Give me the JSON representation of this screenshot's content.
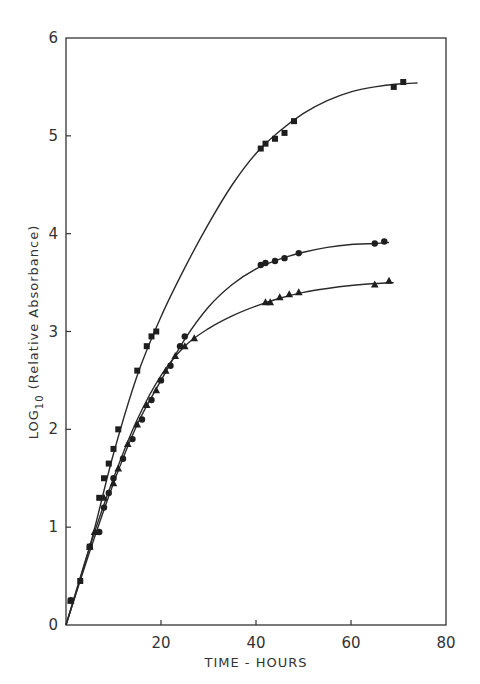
{
  "chart_data": {
    "type": "line",
    "title": "",
    "xlabel": "TIME - HOURS",
    "ylabel": "LOG10 (Relative Absorbance)",
    "ylabel_parts": {
      "main": "LOG",
      "sub": "10",
      "rest": "(Relative Absorbance)"
    },
    "xlim": [
      0,
      80
    ],
    "ylim": [
      0,
      6
    ],
    "x_ticks": [
      20,
      40,
      60,
      80
    ],
    "x_tick_labels": [
      "20",
      "40",
      "60",
      "80"
    ],
    "y_ticks": [
      0,
      1,
      2,
      3,
      4,
      5,
      6
    ],
    "y_tick_labels": [
      "0",
      "1",
      "2",
      "3",
      "4",
      "5",
      "6"
    ],
    "origin_label": "0",
    "grid": false,
    "legend": null,
    "series": [
      {
        "name": "squares",
        "marker": "square",
        "points": [
          [
            1,
            0.25
          ],
          [
            3,
            0.45
          ],
          [
            5,
            0.8
          ],
          [
            7,
            1.3
          ],
          [
            8,
            1.5
          ],
          [
            9,
            1.65
          ],
          [
            10,
            1.8
          ],
          [
            11,
            2.0
          ],
          [
            15,
            2.6
          ],
          [
            17,
            2.85
          ],
          [
            18,
            2.95
          ],
          [
            19,
            3.0
          ],
          [
            41,
            4.87
          ],
          [
            42,
            4.92
          ],
          [
            44,
            4.97
          ],
          [
            46,
            5.03
          ],
          [
            48,
            5.15
          ],
          [
            69,
            5.5
          ],
          [
            71,
            5.55
          ]
        ],
        "curve": [
          [
            0,
            0
          ],
          [
            5,
            0.8
          ],
          [
            10,
            1.75
          ],
          [
            15,
            2.55
          ],
          [
            20,
            3.15
          ],
          [
            25,
            3.65
          ],
          [
            30,
            4.1
          ],
          [
            35,
            4.5
          ],
          [
            40,
            4.82
          ],
          [
            45,
            5.05
          ],
          [
            50,
            5.23
          ],
          [
            55,
            5.36
          ],
          [
            60,
            5.45
          ],
          [
            65,
            5.5
          ],
          [
            70,
            5.53
          ],
          [
            74,
            5.54
          ]
        ]
      },
      {
        "name": "circles",
        "marker": "circle",
        "points": [
          [
            1,
            0.25
          ],
          [
            5,
            0.8
          ],
          [
            7,
            0.95
          ],
          [
            8,
            1.2
          ],
          [
            9,
            1.35
          ],
          [
            10,
            1.5
          ],
          [
            12,
            1.7
          ],
          [
            14,
            1.9
          ],
          [
            16,
            2.1
          ],
          [
            18,
            2.3
          ],
          [
            20,
            2.5
          ],
          [
            22,
            2.65
          ],
          [
            24,
            2.85
          ],
          [
            25,
            2.95
          ],
          [
            41,
            3.68
          ],
          [
            42,
            3.7
          ],
          [
            44,
            3.72
          ],
          [
            46,
            3.75
          ],
          [
            49,
            3.8
          ],
          [
            65,
            3.9
          ],
          [
            67,
            3.92
          ]
        ],
        "curve": [
          [
            0,
            0
          ],
          [
            5,
            0.75
          ],
          [
            10,
            1.45
          ],
          [
            15,
            2.05
          ],
          [
            20,
            2.5
          ],
          [
            25,
            2.92
          ],
          [
            30,
            3.25
          ],
          [
            35,
            3.48
          ],
          [
            40,
            3.64
          ],
          [
            45,
            3.74
          ],
          [
            50,
            3.81
          ],
          [
            55,
            3.86
          ],
          [
            60,
            3.89
          ],
          [
            65,
            3.9
          ],
          [
            68,
            3.91
          ]
        ]
      },
      {
        "name": "triangles",
        "marker": "triangle",
        "points": [
          [
            1,
            0.25
          ],
          [
            5,
            0.8
          ],
          [
            6,
            0.95
          ],
          [
            8,
            1.3
          ],
          [
            10,
            1.45
          ],
          [
            11,
            1.6
          ],
          [
            13,
            1.85
          ],
          [
            15,
            2.05
          ],
          [
            17,
            2.25
          ],
          [
            19,
            2.4
          ],
          [
            21,
            2.6
          ],
          [
            23,
            2.75
          ],
          [
            25,
            2.85
          ],
          [
            27,
            2.93
          ],
          [
            42,
            3.3
          ],
          [
            43,
            3.3
          ],
          [
            45,
            3.35
          ],
          [
            47,
            3.38
          ],
          [
            49,
            3.4
          ],
          [
            65,
            3.48
          ],
          [
            68,
            3.52
          ]
        ],
        "curve": [
          [
            0,
            0
          ],
          [
            5,
            0.8
          ],
          [
            10,
            1.5
          ],
          [
            15,
            2.1
          ],
          [
            20,
            2.55
          ],
          [
            25,
            2.85
          ],
          [
            30,
            3.03
          ],
          [
            35,
            3.16
          ],
          [
            40,
            3.26
          ],
          [
            45,
            3.34
          ],
          [
            50,
            3.4
          ],
          [
            55,
            3.44
          ],
          [
            60,
            3.47
          ],
          [
            65,
            3.49
          ],
          [
            69,
            3.5
          ]
        ]
      }
    ]
  }
}
